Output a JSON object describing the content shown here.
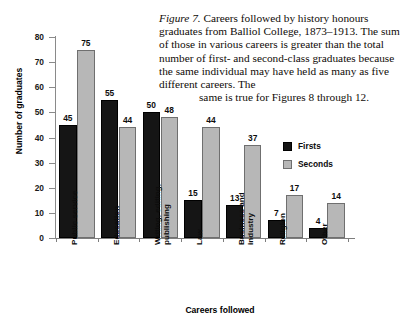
{
  "caption": {
    "figure_label": "Figure 7.",
    "text": " Careers followed by history honours graduates from Balliol College, 1873–1913. The sum of those in various careers is greater than the total number of first- and second-class graduates because the same individual may have held as many as five different careers. The",
    "last_line": "same is true for Figures 8 through 12."
  },
  "legend": {
    "items": [
      {
        "label": "Firsts",
        "color": "#151515"
      },
      {
        "label": "Seconds",
        "color": "#b7b7b7"
      }
    ]
  },
  "chart_data": {
    "type": "bar",
    "title": "",
    "xlabel": "Careers followed",
    "ylabel": "Number of graduates",
    "ylim": [
      0,
      80
    ],
    "yticks": [
      0,
      10,
      20,
      30,
      40,
      50,
      60,
      70,
      80
    ],
    "grid": false,
    "legend_position": "inside-right",
    "categories": [
      "Public service",
      "Education",
      "Writing, editing, publishing",
      "Law",
      "Business and industry",
      "Religion",
      "Other"
    ],
    "category_lines": [
      [
        "Public service",
        ""
      ],
      [
        "Education",
        ""
      ],
      [
        "Writing, editing,",
        "publishing"
      ],
      [
        "Law",
        ""
      ],
      [
        "Business and",
        "industry"
      ],
      [
        "Religion",
        ""
      ],
      [
        "Other",
        ""
      ]
    ],
    "series": [
      {
        "name": "Firsts",
        "color": "#151515",
        "values": [
          45,
          55,
          50,
          15,
          13,
          7,
          4
        ]
      },
      {
        "name": "Seconds",
        "color": "#b7b7b7",
        "values": [
          75,
          44,
          48,
          44,
          37,
          17,
          14
        ]
      }
    ]
  }
}
